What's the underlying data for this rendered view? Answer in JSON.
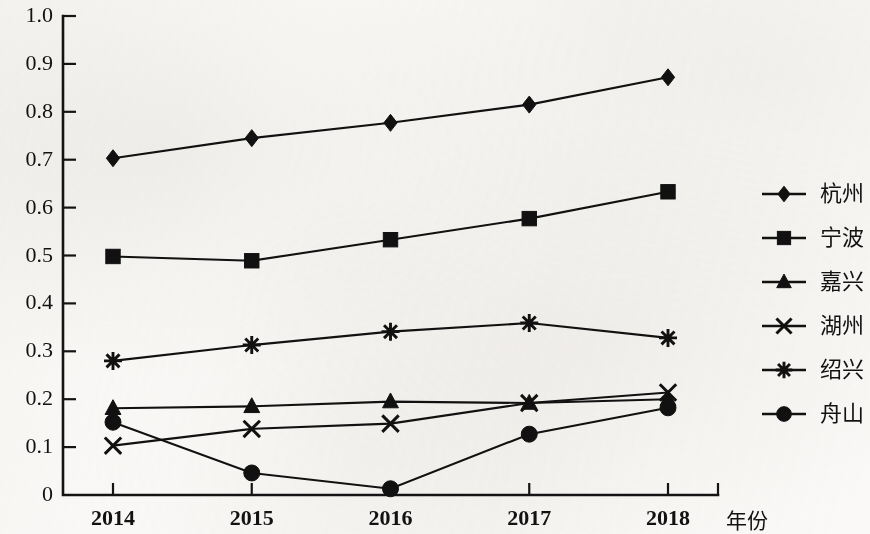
{
  "chart_data": {
    "type": "line",
    "title": "",
    "xlabel": "年份",
    "ylabel": "",
    "categories": [
      "2014",
      "2015",
      "2016",
      "2017",
      "2018"
    ],
    "ylim": [
      0,
      1.0
    ],
    "xlim_labels": [
      "2014",
      "2018"
    ],
    "grid": false,
    "legend_position": "right",
    "y_ticks": [
      "0",
      "0.1",
      "0.2",
      "0.3",
      "0.4",
      "0.5",
      "0.6",
      "0.7",
      "0.8",
      "0.9",
      "1.0"
    ],
    "y_tick_values": [
      0,
      0.1,
      0.2,
      0.3,
      0.4,
      0.5,
      0.6,
      0.7,
      0.8,
      0.9,
      1.0
    ],
    "series": [
      {
        "name": "杭州",
        "marker": "diamond",
        "values": [
          0.703,
          0.745,
          0.777,
          0.815,
          0.872
        ]
      },
      {
        "name": "宁波",
        "marker": "square",
        "values": [
          0.498,
          0.489,
          0.533,
          0.577,
          0.633
        ]
      },
      {
        "name": "嘉兴",
        "marker": "triangle",
        "values": [
          0.181,
          0.185,
          0.195,
          0.192,
          0.2
        ]
      },
      {
        "name": "湖州",
        "marker": "x",
        "values": [
          0.103,
          0.138,
          0.149,
          0.192,
          0.214
        ]
      },
      {
        "name": "绍兴",
        "marker": "star",
        "values": [
          0.28,
          0.313,
          0.341,
          0.359,
          0.328
        ]
      },
      {
        "name": "舟山",
        "marker": "circle",
        "values": [
          0.152,
          0.046,
          0.013,
          0.127,
          0.182
        ]
      }
    ]
  },
  "colors": {
    "ink": "#111111",
    "paper": "#faf9f7"
  }
}
